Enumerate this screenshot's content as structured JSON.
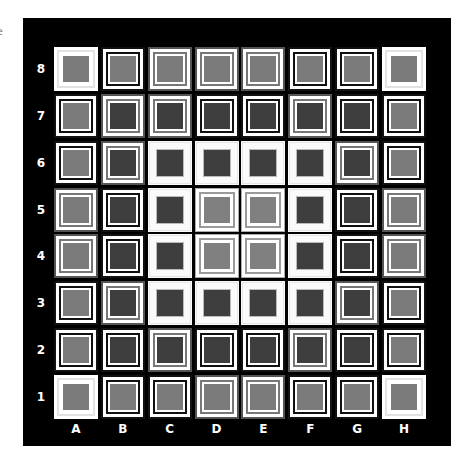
{
  "fragment_text": "e",
  "board": {
    "ranks": [
      "8",
      "7",
      "6",
      "5",
      "4",
      "3",
      "2",
      "1"
    ],
    "files": [
      "A",
      "B",
      "C",
      "D",
      "E",
      "F",
      "G",
      "H"
    ],
    "colors": {
      "background": "#000000",
      "mid_fill": "#7b7b7b",
      "dark_fill": "#3e3e3e",
      "label": "#ffffff"
    },
    "rows": [
      [
        "corner-mid",
        "dblk-mid",
        "dgray-mid",
        "dgray-mid",
        "dgray-mid",
        "dblk-mid",
        "dblk-mid",
        "corner-mid"
      ],
      [
        "dblk-mid",
        "dgray-dark",
        "dgray-dark",
        "dblk-dark",
        "dblk-dark",
        "dgray-dark",
        "dblk-dark",
        "dblk-mid"
      ],
      [
        "dblk-mid",
        "dgray-dark",
        "ring-dark",
        "ring-dark",
        "ring-dark",
        "ring-dark",
        "dgray-dark",
        "dblk-mid"
      ],
      [
        "dgray-mid",
        "dblk-dark",
        "ring-dark",
        "center-mid",
        "center-mid",
        "ring-dark",
        "dblk-dark",
        "dgray-mid"
      ],
      [
        "dgray-mid",
        "dblk-dark",
        "ring-dark",
        "center-mid",
        "center-mid",
        "ring-dark",
        "dblk-dark",
        "dgray-mid"
      ],
      [
        "dblk-mid",
        "dgray-dark",
        "ring-dark",
        "ring-dark",
        "ring-dark",
        "ring-dark",
        "dgray-dark",
        "dblk-mid"
      ],
      [
        "dblk-mid",
        "dblk-dark",
        "dgray-dark",
        "dblk-dark",
        "dblk-dark",
        "dgray-dark",
        "dblk-dark",
        "dblk-mid"
      ],
      [
        "corner-mid",
        "dblk-mid",
        "dblk-mid",
        "dgray-mid",
        "dgray-mid",
        "dblk-mid",
        "dblk-mid",
        "corner-mid"
      ]
    ]
  }
}
